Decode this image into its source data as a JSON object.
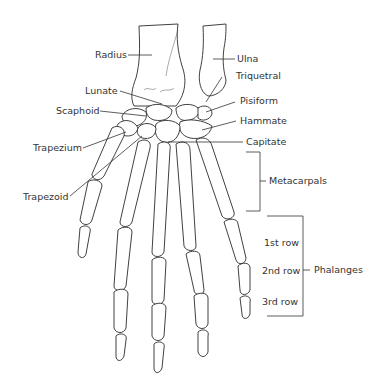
{
  "diagram": {
    "labels": {
      "radius": "Radius",
      "ulna": "Ulna",
      "lunate": "Lunate",
      "triquetral": "Triquetral",
      "scaphoid": "Scaphoid",
      "pisiform": "Pisiform",
      "hammate": "Hammate",
      "capitate": "Capitate",
      "trapezium": "Trapezium",
      "trapezoid": "Trapezoid",
      "metacarpals": "Metacarpals",
      "phalanges": "Phalanges",
      "row1": "1st row",
      "row2": "2nd row",
      "row3": "3rd row"
    },
    "colors": {
      "line": "#2b2b2b",
      "text": "#333333",
      "background": "#ffffff"
    }
  }
}
